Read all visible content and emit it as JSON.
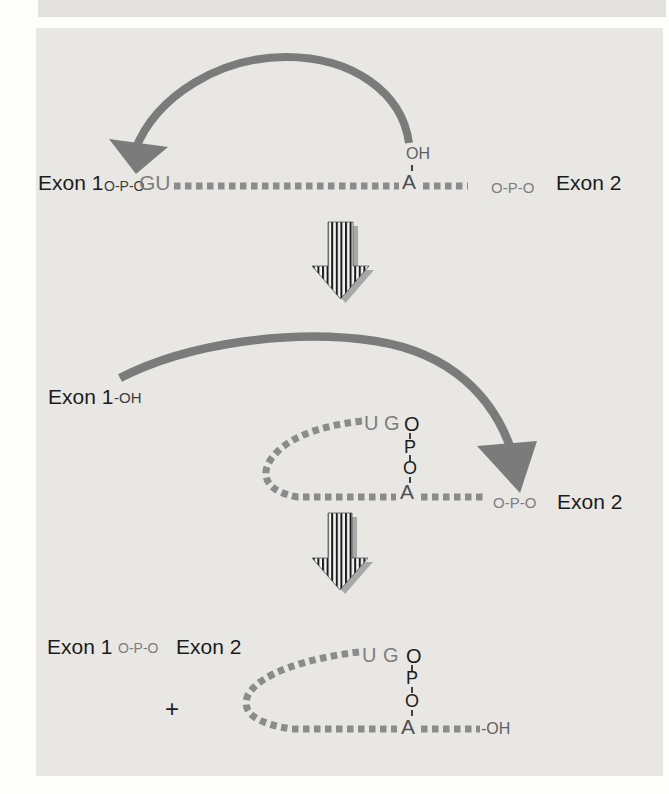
{
  "figure": {
    "step1": {
      "exon1": "Exon 1",
      "phosphate_left": "O-P-O",
      "splice_donor": "GU",
      "hydroxyl": "OH",
      "branch_a": "A",
      "phosphate_right": "O-P-O",
      "exon2": "Exon 2"
    },
    "step2": {
      "exon1": "Exon 1",
      "hydroxyl_suffix": "-OH",
      "lariat": {
        "u": "U",
        "g": "G",
        "o1": "O",
        "p": "P",
        "o2": "O",
        "a": "A"
      },
      "phosphate": "O-P-O",
      "exon2": "Exon 2"
    },
    "step3": {
      "exon1": "Exon 1",
      "phosphate": "O-P-O",
      "exon2": "Exon 2",
      "plus": "+",
      "lariat": {
        "u": "U",
        "g": "G",
        "o1": "O",
        "p": "P",
        "o2": "O",
        "a": "A"
      },
      "hydroxyl_tail": "-OH"
    }
  },
  "colors": {
    "panel": "#e8e7e4",
    "top_strip": "#e2e1df",
    "ink": "#1c1c1c",
    "gray_text": "#7e7e7e",
    "dots": "#8b8b8b",
    "curved_arrow": "#7b7b7b",
    "arrow_shadow": "#a8a8a8"
  }
}
